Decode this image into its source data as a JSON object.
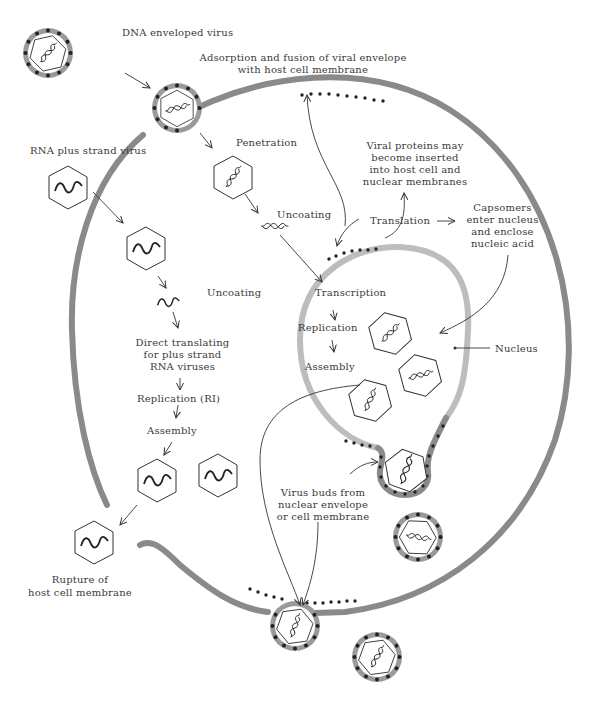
{
  "diagram": {
    "colors": {
      "membrane": "#8a8a8a",
      "nuclear_membrane": "#bdbdbd",
      "particle_dot": "#222222",
      "line": "#333333",
      "text": "#3a3a3a",
      "background": "#ffffff"
    },
    "labels": {
      "dna_virus": "DNA enveloped virus",
      "adsorption_1": "Adsorption and fusion of viral envelope",
      "adsorption_2": "with host cell membrane",
      "rna_virus": "RNA plus strand virus",
      "penetration": "Penetration",
      "uncoating_dna": "Uncoating",
      "uncoating_rna": "Uncoating",
      "viral_proteins_1": "Viral proteins may",
      "viral_proteins_2": "become inserted",
      "viral_proteins_3": "into host cell and",
      "viral_proteins_4": "nuclear membranes",
      "translation": "Translation",
      "capsomers_1": "Capsomers",
      "capsomers_2": "enter nucleus",
      "capsomers_3": "and enclose",
      "capsomers_4": "nucleic acid",
      "transcription": "Transcription",
      "replication": "Replication",
      "assembly_nuc": "Assembly",
      "nucleus": "Nucleus",
      "direct_1": "Direct translating",
      "direct_2": "for plus strand",
      "direct_3": "RNA viruses",
      "replication_ri": "Replication (RI)",
      "assembly_rna": "Assembly",
      "buds_1": "Virus buds from",
      "buds_2": "nuclear envelope",
      "buds_3": "or cell membrane",
      "rupture_1": "Rupture of",
      "rupture_2": "host cell membrane"
    }
  }
}
